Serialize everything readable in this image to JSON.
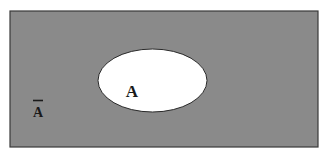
{
  "diagram": {
    "type": "venn",
    "universe": {
      "fill": "#8a8a8a",
      "stroke": "#3a3a3a",
      "x": 10,
      "y": 11,
      "width": 308,
      "height": 136
    },
    "set": {
      "fill": "#ffffff",
      "stroke": "#2a2a2a",
      "cx": 152.5,
      "cy": 80.5,
      "rx": 54.5,
      "ry": 31.5
    },
    "labels": {
      "set_a": "A",
      "complement_a": "A"
    }
  }
}
